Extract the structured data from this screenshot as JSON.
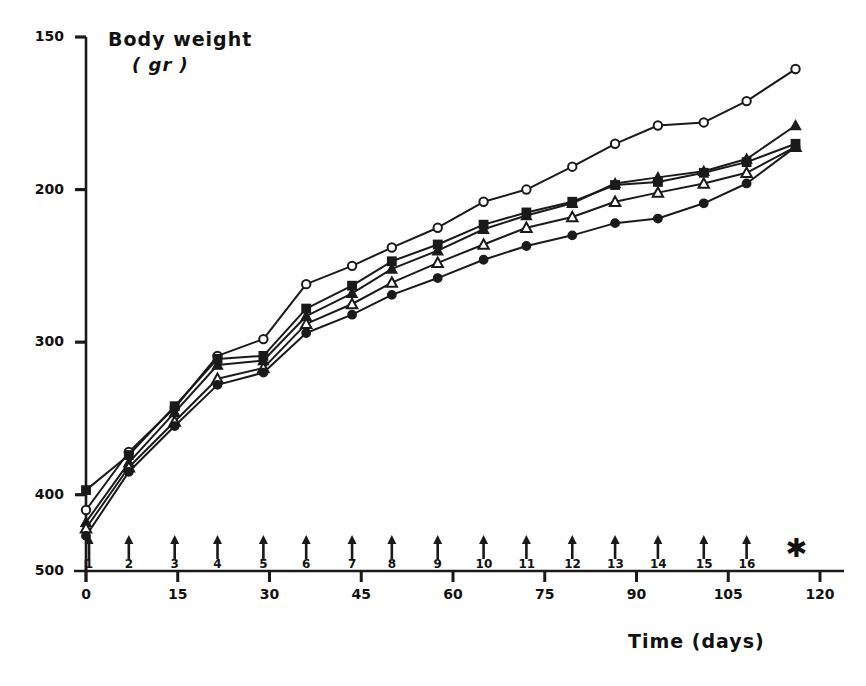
{
  "chart": {
    "type": "line",
    "title": "",
    "ylabel_line1": "Body weight",
    "ylabel_line2": "( gr )",
    "xlabel": "Time (days)",
    "yticks": [
      "500",
      "400",
      "300",
      "200",
      "150"
    ],
    "xticks": [
      "0",
      "15",
      "30",
      "45",
      "60",
      "75",
      "90",
      "105",
      "120"
    ],
    "arrow_numbers": [
      "1",
      "2",
      "3",
      "4",
      "5",
      "6",
      "7",
      "8",
      "9",
      "10",
      "11",
      "12",
      "13",
      "14",
      "15",
      "16"
    ],
    "asterisk": "✱"
  },
  "chart_data": {
    "type": "line",
    "title": "",
    "xlabel": "Time (days)",
    "ylabel": "Body weight (gr)",
    "xlim": [
      0,
      120
    ],
    "ylim": [
      150,
      500
    ],
    "xticks": [
      0,
      15,
      30,
      45,
      60,
      75,
      90,
      105,
      120
    ],
    "yticks": [
      150,
      200,
      300,
      400,
      500
    ],
    "grid": false,
    "legend": "none",
    "annotations": {
      "arrows": {
        "labels": [
          1,
          2,
          3,
          4,
          5,
          6,
          7,
          8,
          9,
          10,
          11,
          12,
          13,
          14,
          15,
          16
        ],
        "x_days": [
          0.5,
          7,
          14.5,
          21.5,
          29,
          36,
          43.5,
          50,
          57.5,
          65,
          72,
          79.5,
          86.5,
          93.5,
          101,
          108
        ],
        "description": "upward arrows below axis marking injection timepoints"
      },
      "asterisk": {
        "x_days": 116,
        "description": "asterisk marking end of treatment period"
      }
    },
    "series": [
      {
        "name": "open-circle",
        "marker": "circle-open",
        "x": [
          0,
          7,
          14.5,
          21.5,
          29,
          36,
          43.5,
          50,
          57.5,
          65,
          72,
          79.5,
          86.5,
          93.5,
          101,
          108,
          116
        ],
        "y": [
          190,
          228,
          257,
          291,
          302,
          338,
          350,
          362,
          375,
          392,
          400,
          415,
          430,
          442,
          444,
          458,
          479
        ]
      },
      {
        "name": "filled-square",
        "marker": "square-filled",
        "x": [
          0,
          7,
          14.5,
          21.5,
          29,
          36,
          43.5,
          50,
          57.5,
          65,
          72,
          79.5,
          86.5,
          93.5,
          101,
          108,
          116
        ],
        "y": [
          203,
          226,
          258,
          289,
          291,
          322,
          337,
          353,
          364,
          377,
          385,
          392,
          403,
          405,
          411,
          418,
          430
        ]
      },
      {
        "name": "filled-triangle",
        "marker": "triangle-filled",
        "x": [
          0,
          7,
          14.5,
          21.5,
          29,
          36,
          43.5,
          50,
          57.5,
          65,
          72,
          79.5,
          86.5,
          93.5,
          101,
          108,
          116
        ],
        "y": [
          182,
          221,
          254,
          285,
          288,
          317,
          332,
          348,
          360,
          374,
          383,
          391,
          404,
          408,
          412,
          420,
          442
        ]
      },
      {
        "name": "open-triangle",
        "marker": "triangle-open",
        "x": [
          0,
          7,
          14.5,
          21.5,
          29,
          36,
          43.5,
          50,
          57.5,
          65,
          72,
          79.5,
          86.5,
          93.5,
          101,
          108,
          116
        ],
        "y": [
          178,
          218,
          248,
          276,
          283,
          312,
          325,
          339,
          352,
          364,
          375,
          382,
          392,
          398,
          404,
          411,
          428
        ]
      },
      {
        "name": "filled-circle",
        "marker": "circle-filled",
        "x": [
          0,
          7,
          14.5,
          21.5,
          29,
          36,
          43.5,
          50,
          57.5,
          65,
          72,
          79.5,
          86.5,
          93.5,
          101,
          108,
          116
        ],
        "y": [
          173,
          215,
          245,
          272,
          280,
          306,
          318,
          331,
          342,
          354,
          363,
          370,
          378,
          381,
          391,
          404,
          428
        ]
      }
    ]
  }
}
